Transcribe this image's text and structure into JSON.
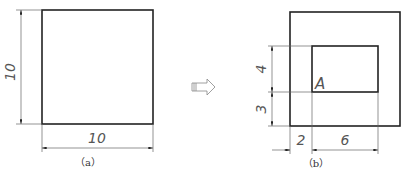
{
  "figure_a": {
    "caption": "（a）",
    "width_label": "10",
    "height_label": "10"
  },
  "arrow": {
    "icon": "hollow-right-arrow-icon"
  },
  "figure_b": {
    "caption": "（b）",
    "point_label": "A",
    "dim_vertical_upper": "4",
    "dim_vertical_lower": "3",
    "dim_horizontal_left": "2",
    "dim_horizontal_right": "6"
  },
  "colors": {
    "outline": "#222222",
    "dimension": "#666666"
  }
}
